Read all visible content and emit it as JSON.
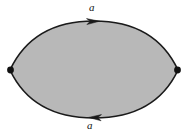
{
  "figure": {
    "background_color": "#ffffff"
  },
  "shape": {
    "name": "bigon",
    "fill_color": "#b8b8b8",
    "stroke_color": "#1a1a1a",
    "stroke_width": 1.6,
    "left_vertex": {
      "x": 10,
      "y": 70
    },
    "right_vertex": {
      "x": 178,
      "y": 70
    },
    "top_apex": {
      "x": 94,
      "y": 21
    },
    "bottom_apex": {
      "x": 94,
      "y": 118
    }
  },
  "vertices": [
    {
      "name": "left-vertex",
      "x": 10,
      "y": 70,
      "radius": 3.2,
      "color": "#111111"
    },
    {
      "name": "right-vertex",
      "x": 178,
      "y": 70,
      "radius": 3.2,
      "color": "#111111"
    }
  ],
  "edges": [
    {
      "name": "top-edge",
      "label": "a",
      "orientation": "left-to-right",
      "arrow_direction": "right",
      "arrow_position": {
        "x": 95,
        "y": 21
      },
      "label_position": {
        "x": 89,
        "y": 2
      }
    },
    {
      "name": "bottom-edge",
      "label": "a",
      "orientation": "right-to-left",
      "arrow_direction": "left",
      "arrow_position": {
        "x": 93,
        "y": 118
      },
      "label_position": {
        "x": 87,
        "y": 120
      }
    }
  ],
  "labels": {
    "top": "a",
    "bottom": "a"
  }
}
